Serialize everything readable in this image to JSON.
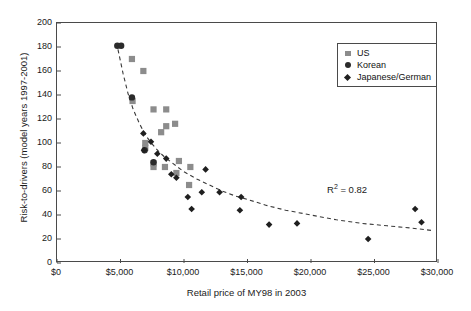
{
  "chart_data": {
    "type": "scatter",
    "title": "",
    "xlabel": "Retail price of MY98 in 2003",
    "ylabel": "Risk-to-drivers (model years 1997-2001)",
    "xlim": [
      0,
      30000
    ],
    "ylim": [
      0,
      200
    ],
    "grid": false,
    "legend_position": "top-right",
    "xticks": [
      0,
      5000,
      10000,
      15000,
      20000,
      25000,
      30000
    ],
    "xtick_labels": [
      "$0",
      "$5,000",
      "$10,000",
      "$15,000",
      "$20,000",
      "$25,000",
      "$30,000"
    ],
    "yticks": [
      0,
      20,
      40,
      60,
      80,
      100,
      120,
      140,
      160,
      180,
      200
    ],
    "ytick_labels": [
      "0",
      "20",
      "40",
      "60",
      "80",
      "100",
      "120",
      "140",
      "160",
      "180",
      "200"
    ],
    "annotations": [
      {
        "name": "r-squared",
        "text": "R² = 0.82",
        "base": "R",
        "exponent": "2",
        "rest": " = 0.82",
        "x": 23200,
        "y": 59
      }
    ],
    "series": [
      {
        "name": "US",
        "marker": "square",
        "color": "#8c8c8c",
        "points": [
          [
            5900,
            170
          ],
          [
            6800,
            160
          ],
          [
            5950,
            135
          ],
          [
            7600,
            128
          ],
          [
            8600,
            128
          ],
          [
            8600,
            114
          ],
          [
            9300,
            116
          ],
          [
            8200,
            109
          ],
          [
            6950,
            100
          ],
          [
            6950,
            96
          ],
          [
            7600,
            83
          ],
          [
            7600,
            80
          ],
          [
            8500,
            80
          ],
          [
            9600,
            85
          ],
          [
            10500,
            80
          ],
          [
            9400,
            75
          ],
          [
            10400,
            65
          ]
        ]
      },
      {
        "name": "Korean",
        "marker": "circle",
        "color": "#2b2b2b",
        "points": [
          [
            4750,
            181
          ],
          [
            5050,
            181
          ],
          [
            5900,
            138
          ],
          [
            6900,
            94
          ],
          [
            7600,
            84
          ]
        ]
      },
      {
        "name": "Japanese/German",
        "marker": "diamond",
        "color": "#1f1f1f",
        "points": [
          [
            6800,
            108
          ],
          [
            7400,
            101
          ],
          [
            6850,
            94
          ],
          [
            7900,
            91
          ],
          [
            8600,
            87
          ],
          [
            9000,
            74
          ],
          [
            9400,
            71
          ],
          [
            10300,
            55
          ],
          [
            10600,
            45
          ],
          [
            11400,
            59
          ],
          [
            11700,
            78
          ],
          [
            12800,
            59
          ],
          [
            14500,
            55
          ],
          [
            14400,
            44
          ],
          [
            16700,
            32
          ],
          [
            18900,
            33
          ],
          [
            24500,
            20
          ],
          [
            28200,
            45
          ],
          [
            28700,
            34
          ]
        ]
      }
    ],
    "trendline": {
      "name": "power-fit-dashed",
      "style": "dashed",
      "color": "#3a3a3a",
      "r_squared": 0.82,
      "points": [
        [
          4800,
          178
        ],
        [
          5200,
          158
        ],
        [
          5600,
          141
        ],
        [
          6000,
          128
        ],
        [
          6500,
          116
        ],
        [
          7000,
          106
        ],
        [
          7500,
          99
        ],
        [
          8000,
          93
        ],
        [
          8500,
          88
        ],
        [
          9000,
          84
        ],
        [
          9500,
          80
        ],
        [
          10000,
          76
        ],
        [
          11000,
          70
        ],
        [
          12000,
          65
        ],
        [
          13000,
          60
        ],
        [
          14000,
          56
        ],
        [
          15000,
          53
        ],
        [
          16500,
          48
        ],
        [
          18000,
          44
        ],
        [
          20000,
          40
        ],
        [
          22000,
          36
        ],
        [
          24000,
          33
        ],
        [
          26000,
          31
        ],
        [
          28000,
          29
        ],
        [
          29600,
          27
        ]
      ]
    }
  },
  "legend": {
    "items": [
      {
        "label": "US",
        "marker": "square"
      },
      {
        "label": "Korean",
        "marker": "circle"
      },
      {
        "label": "Japanese/German",
        "marker": "diamond"
      }
    ]
  }
}
